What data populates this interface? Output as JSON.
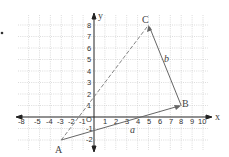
{
  "diagram": {
    "type": "coordinate-plane-vectors",
    "axes": {
      "x_label": "x",
      "y_label": "y",
      "origin_label": "O",
      "x_ticks": [
        "-8",
        "-5",
        "-4",
        "-3",
        "-2",
        "-1",
        "1",
        "2",
        "3",
        "4",
        "5",
        "6",
        "7",
        "8",
        "9",
        "10"
      ],
      "y_ticks": [
        "8",
        "7",
        "6",
        "5",
        "4",
        "3",
        "2",
        "1",
        "-1",
        "-2"
      ]
    },
    "points": {
      "A": {
        "label": "A",
        "x": -3,
        "y": -2
      },
      "B": {
        "label": "B",
        "x": 8,
        "y": 1
      },
      "C": {
        "label": "C",
        "x": 5,
        "y": 8
      }
    },
    "vectors": {
      "a": {
        "label": "a",
        "from": "A",
        "to": "B"
      },
      "b": {
        "label": "b",
        "from": "B",
        "to": "C"
      }
    },
    "dashed": {
      "from": "A",
      "to": "C"
    },
    "colors": {
      "grid": "#bbbbbb",
      "axis": "#222222",
      "vector": "#666666"
    }
  }
}
